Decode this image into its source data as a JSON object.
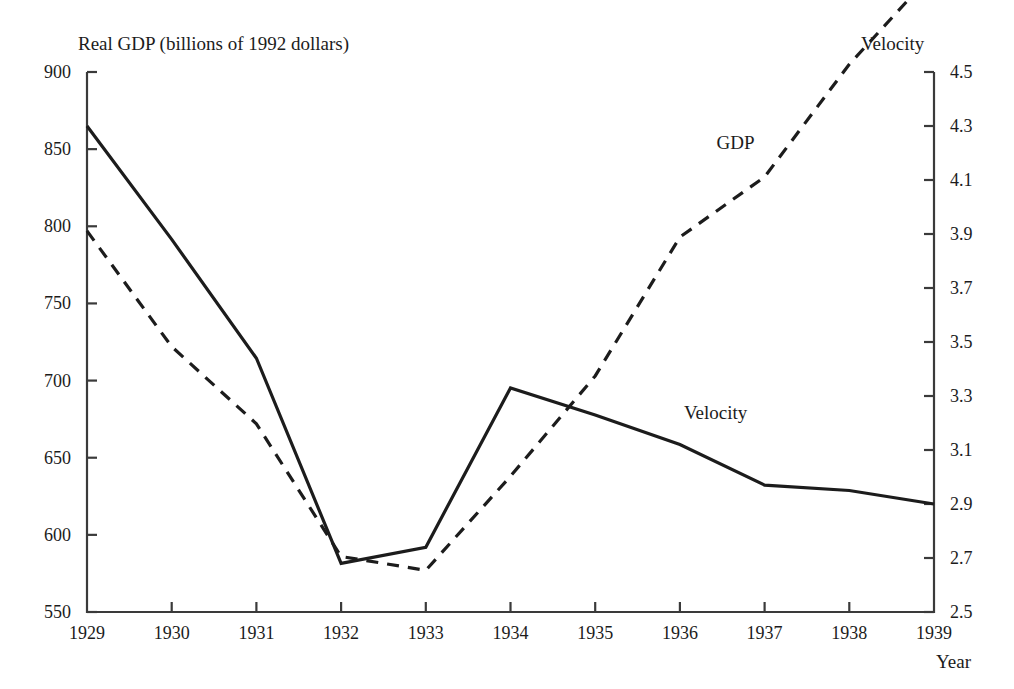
{
  "chart_data": {
    "type": "line",
    "title": "",
    "xlabel": "Year",
    "ylabel": "Real GDP (billions of 1992 dollars)",
    "y2label": "Velocity",
    "grid": false,
    "legend_position": "inline-annotations",
    "x": [
      1929,
      1930,
      1931,
      1932,
      1933,
      1934,
      1935,
      1936,
      1937,
      1938,
      1939
    ],
    "xticklabels": [
      "1929",
      "1930",
      "1931",
      "1932",
      "1933",
      "1934",
      "1935",
      "1936",
      "1937",
      "1938",
      "1939"
    ],
    "ylim": [
      550,
      900
    ],
    "yticks": [
      550,
      600,
      650,
      700,
      750,
      800,
      850,
      900
    ],
    "yticklabels": [
      "550",
      "600",
      "650",
      "700",
      "750",
      "800",
      "850",
      "900"
    ],
    "y2lim": [
      2.5,
      4.5
    ],
    "y2ticks": [
      2.5,
      2.7,
      2.9,
      3.1,
      3.3,
      3.5,
      3.7,
      3.9,
      4.1,
      4.3,
      4.5
    ],
    "y2ticklabels": [
      "2.5",
      "2.7",
      "2.9",
      "3.1",
      "3.3",
      "3.5",
      "3.7",
      "3.9",
      "4.1",
      "4.3",
      "4.5"
    ],
    "series": [
      {
        "name": "GDP",
        "axis": "left",
        "style": "dashed",
        "color": "#1c1c1c",
        "label_text": "GDP",
        "values": [
          797,
          722,
          672,
          586,
          577,
          638,
          703,
          793,
          832,
          905,
          965
        ]
      },
      {
        "name": "Velocity",
        "axis": "right",
        "style": "solid",
        "color": "#1c1c1c",
        "label_text": "Velocity",
        "values": [
          4.3,
          3.88,
          3.44,
          2.68,
          2.74,
          3.33,
          3.23,
          3.12,
          2.97,
          2.95,
          2.9
        ]
      }
    ]
  },
  "annotations": {
    "gdp_label": "GDP",
    "velocity_label": "Velocity"
  },
  "axes": {
    "left_title": "Real GDP (billions of 1992 dollars)",
    "right_title": "Velocity",
    "x_title": "Year"
  }
}
